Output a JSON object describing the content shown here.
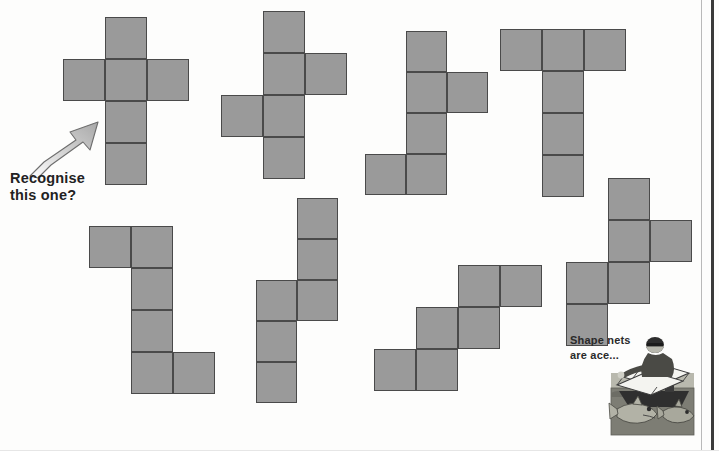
{
  "page": {
    "background_color": "#fdfdfc",
    "width": 719,
    "height": 451,
    "net_fill_color": "#9a9a9a",
    "net_stroke_color": "#4a4a4a",
    "binding_edge_color": "#3a3a3a"
  },
  "annotations": {
    "recognise_caption": "Recognise\nthis one?",
    "cartoon_caption": "Shape nets\nare ace...",
    "arrow_label": "arrow pointing to first net"
  },
  "cartoon": {
    "alt": "Cartoon of a man on a fishing boat holding a shape net over the sea with two sharks below",
    "sea_color": "#7d7d74",
    "sky_color": "#b9b9ae",
    "boat_color": "#3d3d3d",
    "net_color": "#f2f2ee"
  },
  "nets": [
    {
      "id": "net-1",
      "name": "cube-net-cross",
      "label": "Net 1 - cross",
      "origin_x": 63,
      "origin_y": 17,
      "cell": 42,
      "cells": [
        {
          "col": 1,
          "row": 0
        },
        {
          "col": 0,
          "row": 1
        },
        {
          "col": 1,
          "row": 1
        },
        {
          "col": 2,
          "row": 1
        },
        {
          "col": 1,
          "row": 2
        },
        {
          "col": 1,
          "row": 3
        }
      ]
    },
    {
      "id": "net-2",
      "name": "cube-net-zigzag-a",
      "label": "Net 2",
      "origin_x": 221,
      "origin_y": 11,
      "cell": 42,
      "cells": [
        {
          "col": 1,
          "row": 0
        },
        {
          "col": 1,
          "row": 1
        },
        {
          "col": 2,
          "row": 1
        },
        {
          "col": 0,
          "row": 2
        },
        {
          "col": 1,
          "row": 2
        },
        {
          "col": 1,
          "row": 3
        }
      ]
    },
    {
      "id": "net-3",
      "name": "cube-net-zigzag-b",
      "label": "Net 3",
      "origin_x": 365,
      "origin_y": 31,
      "cell": 41,
      "cells": [
        {
          "col": 1,
          "row": 0
        },
        {
          "col": 1,
          "row": 1
        },
        {
          "col": 2,
          "row": 1
        },
        {
          "col": 1,
          "row": 2
        },
        {
          "col": 0,
          "row": 3
        },
        {
          "col": 1,
          "row": 3
        }
      ]
    },
    {
      "id": "net-4",
      "name": "cube-net-tee",
      "label": "Net 4 - T shape",
      "origin_x": 500,
      "origin_y": 29,
      "cell": 42,
      "cells": [
        {
          "col": 0,
          "row": 0
        },
        {
          "col": 1,
          "row": 0
        },
        {
          "col": 2,
          "row": 0
        },
        {
          "col": 1,
          "row": 1
        },
        {
          "col": 1,
          "row": 2
        },
        {
          "col": 1,
          "row": 3
        }
      ]
    },
    {
      "id": "net-5",
      "name": "cube-net-zed",
      "label": "Net 5",
      "origin_x": 89,
      "origin_y": 226,
      "cell": 42,
      "cells": [
        {
          "col": 0,
          "row": 0
        },
        {
          "col": 1,
          "row": 0
        },
        {
          "col": 1,
          "row": 1
        },
        {
          "col": 1,
          "row": 2
        },
        {
          "col": 1,
          "row": 3
        },
        {
          "col": 2,
          "row": 3
        }
      ]
    },
    {
      "id": "net-6",
      "name": "cube-net-offset-columns",
      "label": "Net 6",
      "origin_x": 256,
      "origin_y": 198,
      "cell": 41,
      "cells": [
        {
          "col": 1,
          "row": 0
        },
        {
          "col": 1,
          "row": 1
        },
        {
          "col": 0,
          "row": 2
        },
        {
          "col": 1,
          "row": 2
        },
        {
          "col": 0,
          "row": 3
        },
        {
          "col": 0,
          "row": 4
        }
      ]
    },
    {
      "id": "net-7",
      "name": "cube-net-staircase",
      "label": "Net 7 - staircase",
      "origin_x": 374,
      "origin_y": 265,
      "cell": 42,
      "cells": [
        {
          "col": 2,
          "row": 0
        },
        {
          "col": 3,
          "row": 0
        },
        {
          "col": 1,
          "row": 1
        },
        {
          "col": 2,
          "row": 1
        },
        {
          "col": 0,
          "row": 2
        },
        {
          "col": 1,
          "row": 2
        }
      ]
    },
    {
      "id": "net-8",
      "name": "cube-net-zigzag-c",
      "label": "Net 8",
      "origin_x": 566,
      "origin_y": 178,
      "cell": 42,
      "cells": [
        {
          "col": 1,
          "row": 0
        },
        {
          "col": 1,
          "row": 1
        },
        {
          "col": 2,
          "row": 1
        },
        {
          "col": 0,
          "row": 2
        },
        {
          "col": 1,
          "row": 2
        },
        {
          "col": 0,
          "row": 3
        }
      ]
    }
  ]
}
